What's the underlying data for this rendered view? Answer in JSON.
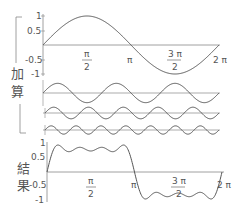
{
  "chart_data": {
    "type": "line",
    "title": "",
    "xlabel": "",
    "ylabel": "",
    "xlim": [
      0,
      6.2832
    ],
    "x_tick_labels": [
      "π/2",
      "π",
      "3π/2",
      "2π"
    ],
    "x_ticks": [
      1.5708,
      3.1416,
      4.7124,
      6.2832
    ],
    "section_labels": {
      "sum_group": "加算",
      "result": "結果"
    },
    "panels": [
      {
        "name": "fundamental",
        "expression": "sin(x)",
        "ylim": [
          -1,
          1
        ],
        "y_tick_labels": [
          "1",
          "0.5",
          "-0.5",
          "-1"
        ],
        "y_ticks": [
          1,
          0.5,
          -0.5,
          -1
        ]
      },
      {
        "name": "harmonic_3",
        "expression": "sin(3x)/3",
        "cycles": 3
      },
      {
        "name": "harmonic_5",
        "expression": "sin(5x)/5",
        "cycles": 5
      },
      {
        "name": "harmonic_7",
        "expression": "sin(7x)/7",
        "cycles": 7
      },
      {
        "name": "result",
        "expression": "sin(x)+sin(3x)/3+sin(5x)/5+sin(7x)/7",
        "ylim": [
          -1,
          1
        ],
        "y_tick_labels": [
          "1",
          "0.5",
          "-0.5",
          "-1"
        ],
        "y_ticks": [
          1,
          0.5,
          -0.5,
          -1
        ]
      }
    ],
    "line_color": "#555555",
    "axis_color": "#888888"
  },
  "labels": {
    "add_1": "加",
    "add_2": "算",
    "res_1": "結",
    "res_2": "果",
    "pi_num": "π",
    "half_den": "2",
    "pi": "π",
    "three_pi": "3 π",
    "two_pi": "2 π",
    "y1": "1",
    "y05": "0.5",
    "yn05": "-0.5",
    "yn1": "-1"
  }
}
